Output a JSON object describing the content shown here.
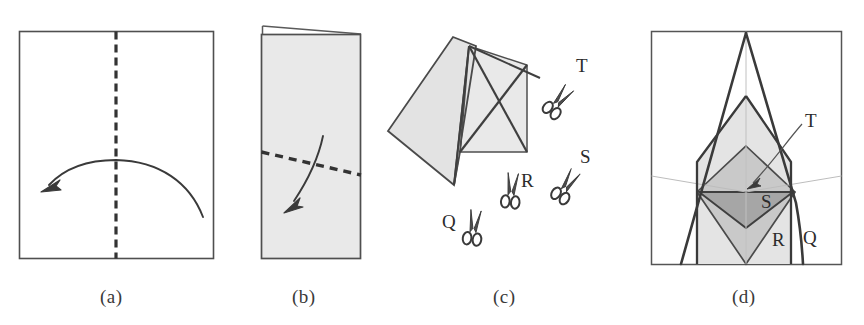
{
  "figure": {
    "width": 864,
    "height": 325,
    "background": "#ffffff",
    "stroke_color": "#4a4a4a",
    "dark_stroke_color": "#3a3a3a",
    "paper_fill": "#e9e9e9",
    "mid_gray_fill": "#c9c9c9",
    "dark_gray_fill": "#a8a8a8",
    "thin_gray": "#b5b5b5"
  },
  "panels": [
    {
      "id": "a",
      "caption": "(a)",
      "description": "Unfolded rectangular sheet with vertical dashed fold line and curved arrow folding right half to the left",
      "fold_line": "vertical-dashed-center",
      "arrow_direction": "right-to-left",
      "fill": "#ffffff"
    },
    {
      "id": "b",
      "caption": "(b)",
      "description": "Sheet folded in half vertically, shaded gray, with diagonal dashed fold line and curved arrow folding top down-left",
      "fold_line": "diagonal-dashed",
      "arrow_direction": "down-left",
      "fill": "#e9e9e9"
    },
    {
      "id": "c",
      "caption": "(c)",
      "description": "Twice-folded paper shown tilted, with crossing cut lines and four scissors marking cut positions",
      "fill": "#e9e9e9",
      "cut_labels": [
        "Q",
        "R",
        "S",
        "T"
      ]
    },
    {
      "id": "d",
      "caption": "(d)",
      "description": "Unfolded result showing nested symmetric shapes produced by each cut",
      "fill": "#e9e9e9",
      "region_labels": [
        "T",
        "S",
        "R",
        "Q"
      ]
    }
  ],
  "cut_markers": [
    {
      "label": "Q",
      "panel": "c",
      "icon": "scissors-icon",
      "orientation": "down"
    },
    {
      "label": "R",
      "panel": "c",
      "icon": "scissors-icon",
      "orientation": "down"
    },
    {
      "label": "S",
      "panel": "c",
      "icon": "scissors-icon",
      "orientation": "down-left"
    },
    {
      "label": "T",
      "panel": "c",
      "icon": "scissors-icon",
      "orientation": "down-left"
    }
  ],
  "result_labels": [
    {
      "label": "T",
      "panel": "d",
      "has_leader_line": true
    },
    {
      "label": "S",
      "panel": "d",
      "has_leader_line": false
    },
    {
      "label": "R",
      "panel": "d",
      "has_leader_line": false
    },
    {
      "label": "Q",
      "panel": "d",
      "has_leader_line": false
    }
  ]
}
